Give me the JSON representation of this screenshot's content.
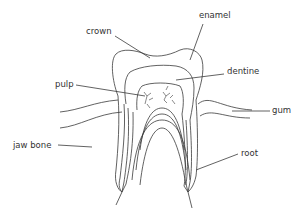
{
  "diagram": {
    "line_color": "#3a3a3a",
    "labels": [
      {
        "id": "crown",
        "text": "crown"
      },
      {
        "id": "enamel",
        "text": "enamel"
      },
      {
        "id": "dentine",
        "text": "dentine"
      },
      {
        "id": "pulp",
        "text": "pulp"
      },
      {
        "id": "gum",
        "text": "gum"
      },
      {
        "id": "jaw_bone",
        "text": "jaw bone"
      },
      {
        "id": "root",
        "text": "root"
      }
    ]
  }
}
